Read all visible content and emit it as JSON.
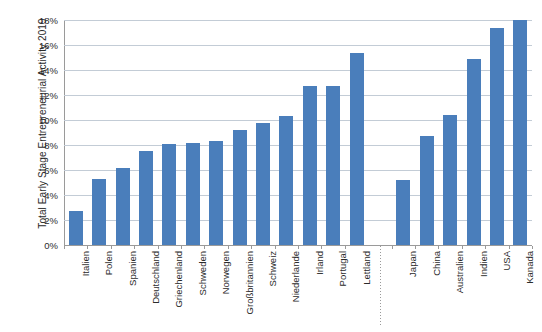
{
  "chart_data": {
    "type": "bar",
    "title": "",
    "xlabel": "",
    "ylabel": "Total Early Stage Entrepreneurial Activity 2019",
    "ylim": [
      0,
      18
    ],
    "ytick_labels": [
      "0%",
      "2%",
      "4%",
      "6%",
      "8%",
      "10%",
      "12%",
      "14%",
      "16%",
      "18%"
    ],
    "ytick_values": [
      0,
      2,
      4,
      6,
      8,
      10,
      12,
      14,
      16,
      18
    ],
    "grid": true,
    "legend": "none",
    "series_color": "#4a7ebb",
    "categories": [
      "Italien",
      "Polen",
      "Spanien",
      "Deutschland",
      "Griechenland",
      "Schweden",
      "Norwegen",
      "Großbritannien",
      "Schweiz",
      "Niederlande",
      "Irland",
      "Portugal",
      "Lettland",
      "Japan",
      "China",
      "Australien",
      "Indien",
      "USA",
      "Kanada"
    ],
    "values": [
      2.7,
      5.3,
      6.2,
      7.5,
      8.1,
      8.2,
      8.3,
      9.2,
      9.8,
      10.3,
      12.7,
      12.7,
      15.4,
      5.2,
      8.7,
      10.4,
      14.9,
      17.4,
      18.0
    ],
    "group_break_after_index": 12,
    "annotations": [
      "dotted vertical divider separating European countries from non-European countries"
    ]
  }
}
